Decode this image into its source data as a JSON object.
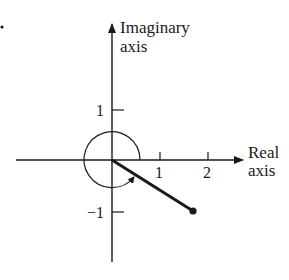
{
  "figure": {
    "marker": "•",
    "axes": {
      "imaginary": {
        "label_line1": "Imaginary",
        "label_line2": "axis"
      },
      "real": {
        "label_line1": "Real",
        "label_line2": "axis"
      }
    },
    "ticks": {
      "real": [
        "1",
        "2"
      ],
      "imaginary_pos": "1",
      "imaginary_neg": "−1"
    },
    "vector": {
      "description": "Line from origin to point in fourth quadrant",
      "real": 1.73,
      "imag": -1.0,
      "end_marker": "filled-dot"
    },
    "angle_arc": {
      "description": "Circle around origin with arrow indicating angle sweep ending at vector",
      "radius_units": 0.58
    },
    "colors": {
      "ink": "#1a1a1a",
      "background": "#ffffff"
    }
  }
}
